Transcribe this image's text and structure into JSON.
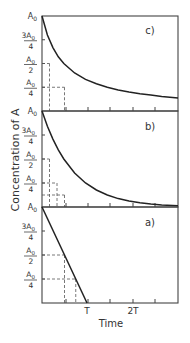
{
  "chart_data": [
    {
      "panel": "c)",
      "type": "line",
      "description": "Second-order decay: successive half-lives double",
      "x_ticks_rel": [
        0.5,
        1,
        1.5,
        2,
        2.5
      ],
      "ylabels": [
        "A0",
        "3A0/4",
        "A0/2",
        "A0/4"
      ],
      "yvalues": [
        1.0,
        0.75,
        0.5,
        0.25
      ],
      "curve": [
        [
          0,
          1.0
        ],
        [
          0.25,
          0.8
        ],
        [
          0.5,
          0.667
        ],
        [
          0.75,
          0.571
        ],
        [
          1,
          0.5
        ],
        [
          1.5,
          0.4
        ],
        [
          2,
          0.333
        ],
        [
          2.5,
          0.286
        ],
        [
          3,
          0.25
        ],
        [
          3.5,
          0.222
        ],
        [
          4,
          0.2
        ],
        [
          4.5,
          0.182
        ],
        [
          5,
          0.167
        ],
        [
          5.5,
          0.154
        ],
        [
          6,
          0.143
        ],
        [
          6.25,
          0.138
        ]
      ],
      "dashed_marks": [
        {
          "x": 1,
          "y": 0.5
        },
        {
          "x": 3,
          "y": 0.25
        }
      ]
    },
    {
      "panel": "b)",
      "type": "line",
      "description": "First-order decay: constant half-life",
      "ylabels": [
        "A0",
        "3A0/4",
        "A0/2",
        "A0/4"
      ],
      "yvalues": [
        1.0,
        0.75,
        0.5,
        0.25
      ],
      "curve": [
        [
          0,
          1.0
        ],
        [
          0.25,
          0.841
        ],
        [
          0.5,
          0.707
        ],
        [
          0.75,
          0.595
        ],
        [
          1,
          0.5
        ],
        [
          1.5,
          0.354
        ],
        [
          2,
          0.25
        ],
        [
          2.5,
          0.177
        ],
        [
          3,
          0.125
        ],
        [
          3.5,
          0.088
        ],
        [
          4,
          0.0625
        ],
        [
          4.5,
          0.044
        ],
        [
          5,
          0.031
        ],
        [
          5.5,
          0.022
        ],
        [
          6,
          0.016
        ],
        [
          6.25,
          0.013
        ]
      ],
      "dashed_marks": [
        {
          "x": 1,
          "y": 0.5
        },
        {
          "x": 2,
          "y": 0.25
        },
        {
          "x": 3,
          "y": 0.125
        }
      ]
    },
    {
      "panel": "a)",
      "type": "line",
      "description": "Zero-order decay: linear, reaches zero at T",
      "ylabels": [
        "A0",
        "3A0/4",
        "A0/2",
        "A0/4"
      ],
      "yvalues": [
        1.0,
        0.75,
        0.5,
        0.25
      ],
      "curve": [
        [
          0,
          1.0
        ],
        [
          6,
          0.0
        ]
      ],
      "dashed_marks": [
        {
          "x": 3,
          "y": 0.5
        },
        {
          "x": 4.5,
          "y": 0.25
        }
      ],
      "x_tick_labels": [
        {
          "x": 6,
          "label": "T"
        },
        {
          "x": 12,
          "label": "2T"
        }
      ]
    }
  ],
  "labels": {
    "ylabel": "Concentration of A",
    "xlabel": "Time",
    "panel_c": "c)",
    "panel_b": "b)",
    "panel_a": "a)",
    "tick_T": "T",
    "tick_2T": "2T",
    "A0": "A",
    "A0_sub": "0",
    "three": "3A",
    "four": "4",
    "two": "2"
  }
}
